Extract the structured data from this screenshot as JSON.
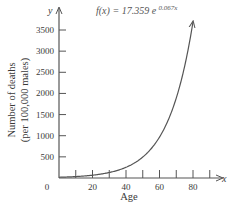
{
  "chart_data": {
    "type": "line",
    "title": "",
    "formula": {
      "prefix": "f(x) = 17.359",
      "base": "e",
      "exponent": "0.067x"
    },
    "function": {
      "a": 17.359,
      "k": 0.067
    },
    "xlabel": "Age",
    "ylabel_line1": "Number of deaths",
    "ylabel_line2": "(per 100,000 males)",
    "x_axis_var": "x",
    "y_axis_var": "y",
    "xlim": [
      0,
      95
    ],
    "ylim": [
      0,
      3700
    ],
    "x_ticks": [
      10,
      20,
      30,
      40,
      50,
      60,
      70,
      80,
      90
    ],
    "x_tick_labels": [
      {
        "value": 0,
        "label": "0"
      },
      {
        "value": 20,
        "label": "20"
      },
      {
        "value": 40,
        "label": "40"
      },
      {
        "value": 60,
        "label": "60"
      },
      {
        "value": 80,
        "label": "80"
      }
    ],
    "y_ticks": [
      500,
      1000,
      1500,
      2000,
      2500,
      3000,
      3500
    ],
    "y_tick_labels": [
      "500",
      "1000",
      "1500",
      "2000",
      "2500",
      "3000",
      "3500"
    ],
    "curve_x_range": [
      0,
      80
    ],
    "grid": false,
    "legend": "none"
  }
}
